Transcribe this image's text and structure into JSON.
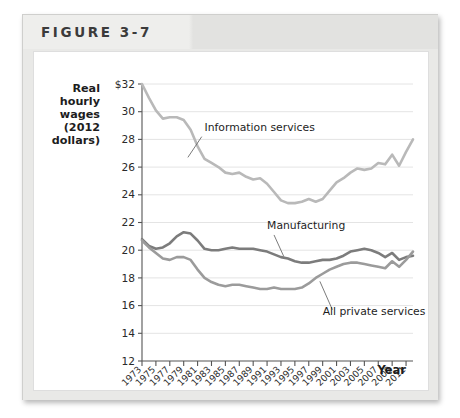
{
  "figure": {
    "title": "FIGURE 3-7"
  },
  "chart_data": {
    "type": "line",
    "title": "",
    "xlabel": "Year",
    "ylabel": "Real hourly wages (2012 dollars)",
    "ylabel_lines": [
      "Real",
      "hourly",
      "wages",
      "(2012",
      "dollars)"
    ],
    "grid": true,
    "legend_position": "inline-annotations",
    "xlim": [
      1973,
      2012
    ],
    "ylim": [
      12,
      32
    ],
    "yticks": [
      12,
      14,
      16,
      18,
      20,
      22,
      24,
      26,
      28,
      30,
      32
    ],
    "ytick_labels": [
      "12",
      "14",
      "16",
      "18",
      "20",
      "22",
      "24",
      "26",
      "28",
      "30",
      "$32"
    ],
    "xticks": [
      1973,
      1975,
      1977,
      1979,
      1981,
      1983,
      1985,
      1987,
      1989,
      1991,
      1993,
      1995,
      1997,
      1999,
      2001,
      2003,
      2005,
      2007,
      2009,
      2011
    ],
    "xtick_labels": [
      "1973",
      "1975",
      "1977",
      "1979",
      "1981",
      "1983",
      "1985",
      "1987",
      "1989",
      "1991",
      "1993",
      "1995",
      "1997",
      "1999",
      "2001",
      "2003",
      "2005",
      "2007",
      "2009",
      "2011"
    ],
    "x": [
      1973,
      1974,
      1975,
      1976,
      1977,
      1978,
      1979,
      1980,
      1981,
      1982,
      1983,
      1984,
      1985,
      1986,
      1987,
      1988,
      1989,
      1990,
      1991,
      1992,
      1993,
      1994,
      1995,
      1996,
      1997,
      1998,
      1999,
      2000,
      2001,
      2002,
      2003,
      2004,
      2005,
      2006,
      2007,
      2008,
      2009,
      2010,
      2011,
      2012
    ],
    "series": [
      {
        "name": "Information services",
        "label": "Information services",
        "color": "#b9b9b9",
        "values": [
          32.0,
          31.0,
          30.1,
          29.5,
          29.6,
          29.6,
          29.4,
          28.7,
          27.5,
          26.6,
          26.3,
          26.0,
          25.6,
          25.5,
          25.6,
          25.3,
          25.1,
          25.2,
          24.8,
          24.2,
          23.6,
          23.4,
          23.4,
          23.5,
          23.7,
          23.5,
          23.7,
          24.3,
          24.9,
          25.2,
          25.6,
          25.9,
          25.8,
          25.9,
          26.3,
          26.2,
          26.9,
          26.1,
          27.1,
          28.0
        ]
      },
      {
        "name": "Manufacturing",
        "label": "Manufacturing",
        "color": "#7c7c7c",
        "values": [
          20.8,
          20.3,
          20.1,
          20.2,
          20.5,
          21.0,
          21.3,
          21.2,
          20.7,
          20.1,
          20.0,
          20.0,
          20.1,
          20.2,
          20.1,
          20.1,
          20.1,
          20.0,
          19.9,
          19.7,
          19.5,
          19.4,
          19.2,
          19.1,
          19.1,
          19.2,
          19.3,
          19.3,
          19.4,
          19.6,
          19.9,
          20.0,
          20.1,
          20.0,
          19.8,
          19.5,
          19.8,
          19.3,
          19.5,
          19.6
        ]
      },
      {
        "name": "All private services",
        "label": "All private services",
        "color": "#9b9b9b",
        "values": [
          20.7,
          20.2,
          19.8,
          19.4,
          19.3,
          19.5,
          19.5,
          19.3,
          18.6,
          18.0,
          17.7,
          17.5,
          17.4,
          17.5,
          17.5,
          17.4,
          17.3,
          17.2,
          17.2,
          17.3,
          17.2,
          17.2,
          17.2,
          17.3,
          17.6,
          18.0,
          18.3,
          18.6,
          18.8,
          19.0,
          19.1,
          19.1,
          19.0,
          18.9,
          18.8,
          18.7,
          19.2,
          18.8,
          19.3,
          19.9
        ]
      }
    ],
    "annotations": [
      {
        "text": "Information services",
        "x": 1982,
        "y": 28.6
      },
      {
        "text": "Manufacturing",
        "x": 1991,
        "y": 21.5
      },
      {
        "text": "All private services",
        "x": 1999,
        "y": 15.3
      }
    ]
  }
}
